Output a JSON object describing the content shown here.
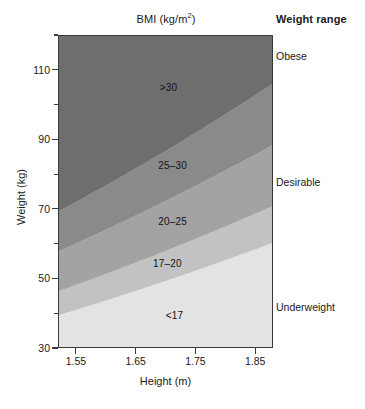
{
  "chart_data": {
    "type": "area",
    "title_base": "BMI (kg/m",
    "title_sup": "2",
    "title_close": ")",
    "xlabel": "Height (m)",
    "ylabel": "Weight (kg)",
    "xlim": [
      1.52,
      1.88
    ],
    "ylim": [
      30,
      120
    ],
    "xticks": [
      "1.55",
      "1.65",
      "1.75",
      "1.85"
    ],
    "xtick_values": [
      1.55,
      1.65,
      1.75,
      1.85
    ],
    "yticks": [
      "110",
      "90",
      "70",
      "50",
      "30"
    ],
    "ytick_values": [
      110,
      90,
      70,
      50,
      30
    ],
    "grid": false,
    "legend_position": "right",
    "legend_title": "Weight range",
    "bmi_boundaries": [
      17,
      20,
      25,
      30
    ],
    "bands": [
      {
        "label": "<17",
        "bmi_min": 0,
        "bmi_max": 17,
        "color": "#e3e3e3",
        "weight_range": "Underweight",
        "label_x": 1.715,
        "label_y": 39.5
      },
      {
        "label": "17–20",
        "bmi_min": 17,
        "bmi_max": 20,
        "color": "#c2c2c2",
        "weight_range": "Underweight",
        "label_x": 1.703,
        "label_y": 54.5
      },
      {
        "label": "20–25",
        "bmi_min": 20,
        "bmi_max": 25,
        "color": "#a3a3a3",
        "weight_range": "Desirable",
        "label_x": 1.712,
        "label_y": 66.5
      },
      {
        "label": "25–30",
        "bmi_min": 25,
        "bmi_max": 30,
        "color": "#8a8a8a",
        "weight_range": "Desirable",
        "label_x": 1.712,
        "label_y": 82.5
      },
      {
        "label": ">30",
        "bmi_min": 30,
        "bmi_max": 999,
        "color": "#6e6e6e",
        "weight_range": "Obese",
        "label_x": 1.705,
        "label_y": 105.0
      }
    ],
    "legend_items": [
      {
        "label": "Obese",
        "y_px": 56
      },
      {
        "label": "Desirable",
        "y_px": 182
      },
      {
        "label": "Underweight",
        "y_px": 307
      }
    ],
    "axis_color": "#3a3a3a",
    "text_color": "#1a1a1a"
  }
}
